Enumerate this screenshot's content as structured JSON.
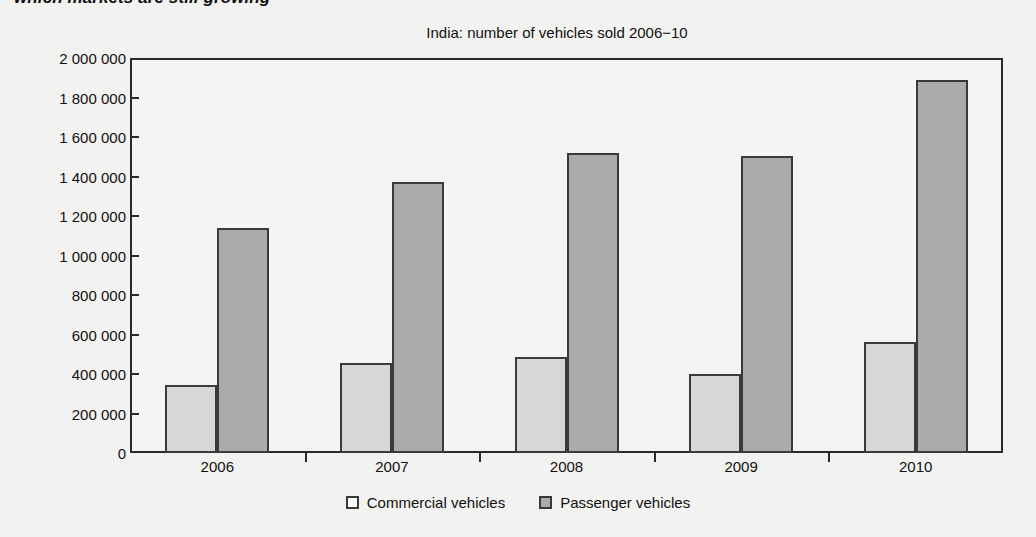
{
  "headline": "which markets are still growing",
  "chart_data": {
    "type": "bar",
    "title": "India: number of vehicles sold 2006−10",
    "xlabel": "",
    "ylabel": "",
    "categories": [
      "2006",
      "2007",
      "2008",
      "2009",
      "2010"
    ],
    "series": [
      {
        "name": "Commercial vehicles",
        "color": "#d7d7d5",
        "values": [
          345000,
          455000,
          485000,
          400000,
          560000
        ]
      },
      {
        "name": "Passenger vehicles",
        "color": "#ababab",
        "values": [
          1140000,
          1370000,
          1520000,
          1505000,
          1890000
        ]
      }
    ],
    "ylim": [
      0,
      2000000
    ],
    "ytick_values": [
      0,
      200000,
      400000,
      600000,
      800000,
      1000000,
      1200000,
      1400000,
      1600000,
      1800000,
      2000000
    ],
    "ytick_labels": [
      "0",
      "200 000",
      "400 000",
      "600 000",
      "800 000",
      "1 000 000",
      "1 200 000",
      "1 400 000",
      "1 600 000",
      "1 800 000",
      "2 000 000"
    ],
    "grid": false,
    "legend_position": "bottom",
    "frame_color": "#2a2a2a",
    "background_color": "#f4f4f2"
  }
}
